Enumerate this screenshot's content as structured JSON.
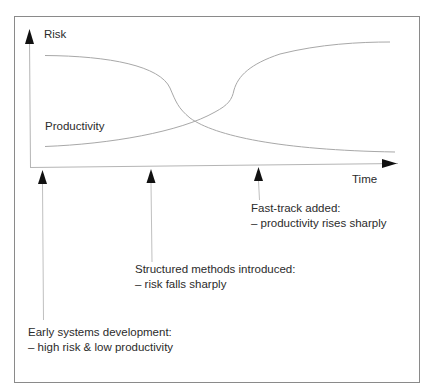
{
  "diagram": {
    "type": "conceptual-line-diagram",
    "axes": {
      "y_label": "Risk",
      "x_label": "Time"
    },
    "curves": [
      {
        "name": "Risk",
        "trend": "starts high, falls sharply mid-way, levels off low"
      },
      {
        "name": "Productivity",
        "label": "Productivity",
        "trend": "starts low, rises sharply later, levels off high"
      }
    ],
    "curve_labels": {
      "productivity": "Productivity"
    },
    "markers": [
      {
        "id": "early",
        "title": "Early systems development:",
        "detail": "– high risk & low productivity"
      },
      {
        "id": "structured",
        "title": "Structured methods introduced:",
        "detail": "– risk falls sharply"
      },
      {
        "id": "fasttrack",
        "title": "Fast-track added:",
        "detail": "– productivity rises sharply"
      }
    ],
    "colors": {
      "frame": "#8a8a8a",
      "axis": "#b0b0b0",
      "curve": "#a8a8a8",
      "arrowhead": "#111111",
      "text": "#2b2b2b"
    }
  }
}
